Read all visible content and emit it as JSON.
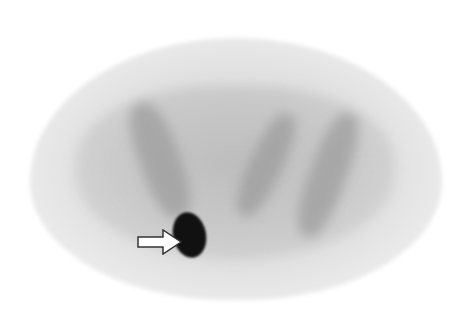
{
  "image": {
    "type": "PET axial scan (grayscale)",
    "background_color": "#ffffff",
    "annotation": {
      "icon": "arrow-right-icon",
      "points_to": "focal hypermetabolic lesion",
      "color": "#ffffff",
      "outline_color": "#333333"
    },
    "lesion_color": "#111111"
  }
}
